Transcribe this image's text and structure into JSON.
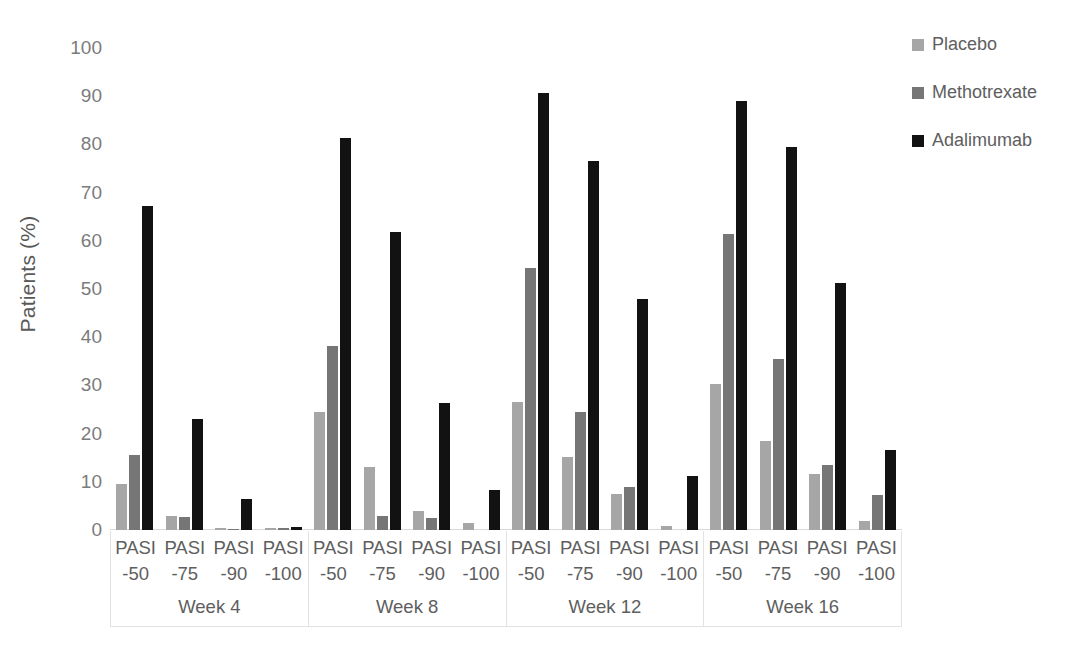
{
  "chart_data": {
    "type": "bar",
    "title": "",
    "xlabel": "",
    "ylabel": "Patients (%)",
    "ylim": [
      0,
      100
    ],
    "ytick_labels": [
      "100",
      "90",
      "80",
      "70",
      "60",
      "50",
      "40",
      "30",
      "20",
      "10",
      "0"
    ],
    "ytick_values": [
      100,
      90,
      80,
      70,
      60,
      50,
      40,
      30,
      20,
      10,
      0
    ],
    "grid": false,
    "legend_position": "top-right",
    "groups": [
      "Week 4",
      "Week 8",
      "Week 12",
      "Week 16"
    ],
    "categories": [
      "PASI -50",
      "PASI -75",
      "PASI -90",
      "PASI -100"
    ],
    "category_lines": [
      {
        "top": "PASI",
        "bottom": "-50"
      },
      {
        "top": "PASI",
        "bottom": "-75"
      },
      {
        "top": "PASI",
        "bottom": "-90"
      },
      {
        "top": "PASI",
        "bottom": "-100"
      }
    ],
    "series": [
      {
        "name": "Placebo",
        "color": "#a6a6a6",
        "values": [
          [
            9.6,
            2.9,
            0.4,
            0.5
          ],
          [
            24.5,
            13.1,
            3.9,
            1.5
          ],
          [
            26.5,
            15.2,
            7.5,
            0.9
          ],
          [
            30.3,
            18.5,
            11.6,
            1.9
          ]
        ]
      },
      {
        "name": "Methotrexate",
        "color": "#767676",
        "values": [
          [
            15.6,
            2.7,
            0.3,
            0.5
          ],
          [
            38.2,
            2.9,
            2.5,
            0.0
          ],
          [
            54.3,
            24.4,
            9.0,
            0.0
          ],
          [
            61.4,
            35.4,
            13.5,
            7.2
          ]
        ]
      },
      {
        "name": "Adalimumab",
        "color": "#121212",
        "values": [
          [
            67.3,
            23.1,
            6.4,
            0.6
          ],
          [
            81.4,
            61.9,
            26.4,
            8.4
          ],
          [
            90.7,
            76.6,
            47.9,
            11.2
          ],
          [
            89.0,
            79.5,
            51.2,
            16.7
          ]
        ]
      }
    ]
  },
  "legend": {
    "items": [
      {
        "label": "Placebo",
        "swatch": "placebo"
      },
      {
        "label": "Methotrexate",
        "swatch": "mtx"
      },
      {
        "label": "Adalimumab",
        "swatch": "ada"
      }
    ]
  }
}
